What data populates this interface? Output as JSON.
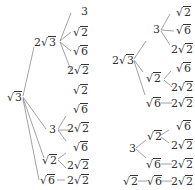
{
  "left_tree": {
    "root": {
      "label": "√3",
      "coef": "",
      "radicand": "3"
    },
    "children": [
      {
        "coef": "2",
        "radicand": "3",
        "leaves": [
          {
            "coef": "",
            "radicand": "",
            "plain": "3"
          },
          {
            "coef": "",
            "radicand": "2"
          },
          {
            "coef": "",
            "radicand": "6"
          },
          {
            "coef": "2",
            "radicand": "2"
          }
        ]
      },
      {
        "coef": "",
        "radicand": "",
        "plain": "3",
        "leaves": [
          {
            "coef": "",
            "radicand": "2"
          },
          {
            "coef": "",
            "radicand": "6"
          },
          {
            "coef": "2",
            "radicand": "2"
          }
        ]
      },
      {
        "coef": "",
        "radicand": "2",
        "leaves": [
          {
            "coef": "",
            "radicand": "6"
          },
          {
            "coef": "2",
            "radicand": "2"
          }
        ]
      },
      {
        "coef": "",
        "radicand": "6",
        "leaves": [
          {
            "coef": "2",
            "radicand": "2"
          }
        ]
      }
    ]
  },
  "right_tree": {
    "root": {
      "coef": "2",
      "radicand": "3"
    },
    "children": [
      {
        "plain": "3",
        "leaves": [
          {
            "coef": "",
            "radicand": "2"
          },
          {
            "coef": "",
            "radicand": "6"
          },
          {
            "coef": "2",
            "radicand": "2"
          }
        ]
      },
      {
        "coef": "",
        "radicand": "2",
        "leaves": [
          {
            "coef": "",
            "radicand": "6"
          },
          {
            "coef": "2",
            "radicand": "2"
          }
        ]
      },
      {
        "coef": "",
        "radicand": "6",
        "leaves": [
          {
            "coef": "2",
            "radicand": "2"
          }
        ]
      }
    ]
  },
  "right_tree_2": {
    "root": {
      "plain": "3"
    },
    "children": [
      {
        "coef": "",
        "radicand": "2",
        "leaves": [
          {
            "coef": "",
            "radicand": "6"
          },
          {
            "coef": "2",
            "radicand": "2"
          }
        ]
      },
      {
        "coef": "",
        "radicand": "6",
        "leaves": [
          {
            "coef": "2",
            "radicand": "2"
          }
        ]
      }
    ]
  },
  "right_chain": [
    {
      "coef": "",
      "radicand": "2"
    },
    {
      "coef": "",
      "radicand": "6"
    },
    {
      "coef": "2",
      "radicand": "2"
    }
  ],
  "symbols": {
    "sqrt": "√"
  }
}
